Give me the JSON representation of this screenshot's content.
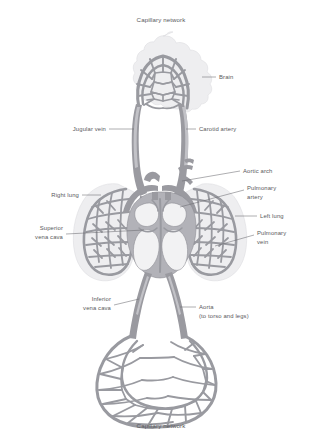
{
  "diagram": {
    "background_color": "#ffffff",
    "vessel_color": "#9a9aa0",
    "organ_halo_color": "#eeeef0",
    "label_color": "#58585c",
    "leader_line_color": "#6b6b70"
  },
  "captions": {
    "top": "Capillary network",
    "bottom": "Capillary network"
  },
  "labels": {
    "brain": "Brain",
    "jugular_vein": "Jugular vein",
    "carotid_artery": "Carotid artery",
    "aortic_arch": "Aortic arch",
    "pulmonary_artery_line1": "Pulmonary",
    "pulmonary_artery_line2": "artery",
    "left_lung": "Left lung",
    "pulmonary_vein_line1": "Pulmonary",
    "pulmonary_vein_line2": "vein",
    "right_lung": "Right lung",
    "superior_vena_cava_line1": "Superior",
    "superior_vena_cava_line2": "vena cava",
    "inferior_vena_cava_line1": "Inferior",
    "inferior_vena_cava_line2": "vena cava",
    "aorta_line1": "Aorta",
    "aorta_line2": "(to torso and legs)"
  },
  "structures": [
    {
      "name": "brain-capillary-network",
      "label": "Brain"
    },
    {
      "name": "jugular-vein",
      "label": "Jugular vein"
    },
    {
      "name": "carotid-artery",
      "label": "Carotid artery"
    },
    {
      "name": "aortic-arch",
      "label": "Aortic arch"
    },
    {
      "name": "pulmonary-artery",
      "label": "Pulmonary artery"
    },
    {
      "name": "pulmonary-vein",
      "label": "Pulmonary vein"
    },
    {
      "name": "right-lung",
      "label": "Right lung"
    },
    {
      "name": "left-lung",
      "label": "Left lung"
    },
    {
      "name": "heart",
      "label": "Heart"
    },
    {
      "name": "superior-vena-cava",
      "label": "Superior vena cava"
    },
    {
      "name": "inferior-vena-cava",
      "label": "Inferior vena cava"
    },
    {
      "name": "aorta",
      "label": "Aorta (to torso and legs)"
    },
    {
      "name": "lower-capillary-network",
      "label": "Capillary network"
    }
  ]
}
